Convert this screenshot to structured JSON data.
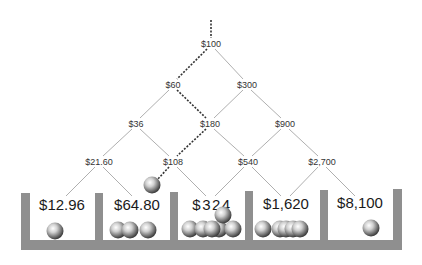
{
  "diagram": {
    "title": "",
    "colors": {
      "wall": "#8f8f8f",
      "edge": "#9a9a9a",
      "path": "#333333",
      "text": "#222222"
    },
    "tree": {
      "levels": [
        [
          {
            "label": "$100",
            "x": 211,
            "y": 44
          }
        ],
        [
          {
            "label": "$60",
            "x": 173,
            "y": 85
          },
          {
            "label": "$300",
            "x": 247,
            "y": 85
          }
        ],
        [
          {
            "label": "$36",
            "x": 136,
            "y": 124
          },
          {
            "label": "$180",
            "x": 210,
            "y": 124
          },
          {
            "label": "$900",
            "x": 285,
            "y": 124
          }
        ],
        [
          {
            "label": "$21.60",
            "x": 99,
            "y": 162
          },
          {
            "label": "$108",
            "x": 173,
            "y": 162
          },
          {
            "label": "$540",
            "x": 248,
            "y": 162
          },
          {
            "label": "$2,700",
            "x": 322,
            "y": 162
          }
        ]
      ],
      "path_highlight": [
        "$100",
        "$60",
        "$180",
        "$108"
      ]
    },
    "bins": [
      {
        "label": "$12.96",
        "balls": 1
      },
      {
        "label": "$64.80",
        "balls": 3
      },
      {
        "label": "$324",
        "balls": 7
      },
      {
        "label": "$1,620",
        "balls": 5
      },
      {
        "label": "$8,100",
        "balls": 1
      }
    ],
    "falling_ball": {
      "x": 152,
      "y": 184
    }
  }
}
